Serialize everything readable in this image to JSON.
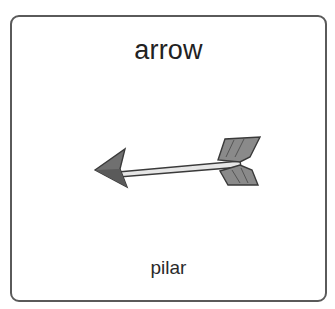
{
  "card": {
    "title": "arrow",
    "caption": "pilar",
    "image": {
      "icon": "arrow-icon",
      "description": "arrow pointing left"
    }
  },
  "colors": {
    "border": "#5a5a5a",
    "text": "#222222",
    "arrow_head": "#707070",
    "arrow_shaft": "#e6e6e6",
    "arrow_fletching": "#8a8a8a"
  }
}
